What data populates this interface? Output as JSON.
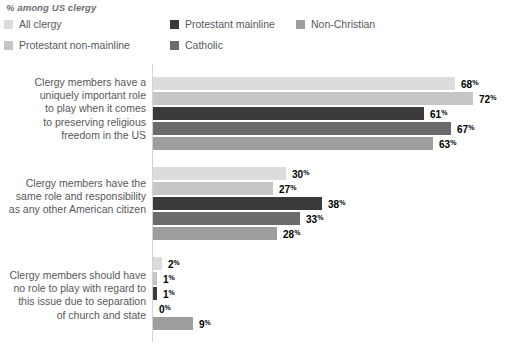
{
  "chart_data": {
    "type": "bar",
    "orientation": "horizontal",
    "title": "% among US clergy",
    "xlabel": "",
    "ylabel": "",
    "xlim": [
      0,
      72
    ],
    "grid": false,
    "legend_position": "top-left",
    "value_suffix": "%",
    "categories": [
      "Clergy members have a uniquely important role to play when it comes to preserving religious freedom in the US",
      "Clergy members have the same role and responsibility as any other American citizen",
      "Clergy members should have no role to play with regard to this issue due to separation of church and state"
    ],
    "category_lines": [
      [
        "Clergy members have a",
        "uniquely important role",
        "to play when it comes",
        "to preserving religious",
        "freedom in the US"
      ],
      [
        "Clergy members have the",
        "same role and responsibility",
        "as any other American citizen"
      ],
      [
        "Clergy members should have",
        "no role to play with regard to",
        "this issue due to separation",
        "of church and state"
      ]
    ],
    "series": [
      {
        "name": "All clergy",
        "color": "#dcdcdc",
        "values": [
          68,
          30,
          2
        ]
      },
      {
        "name": "Protestant non-mainline",
        "color": "#c6c6c6",
        "values": [
          72,
          27,
          1
        ]
      },
      {
        "name": "Protestant mainline",
        "color": "#3a3a3a",
        "values": [
          61,
          38,
          1
        ]
      },
      {
        "name": "Catholic",
        "color": "#6b6b6b",
        "values": [
          67,
          33,
          0
        ]
      },
      {
        "name": "Non-Christian",
        "color": "#9e9e9e",
        "values": [
          63,
          28,
          9
        ]
      }
    ],
    "legend_order": [
      {
        "name": "All clergy",
        "color": "#dcdcdc"
      },
      {
        "name": "Protestant mainline",
        "color": "#3a3a3a"
      },
      {
        "name": "Non-Christian",
        "color": "#9e9e9e"
      },
      {
        "name": "Protestant non-mainline",
        "color": "#c6c6c6"
      },
      {
        "name": "Catholic",
        "color": "#6b6b6b"
      }
    ]
  }
}
